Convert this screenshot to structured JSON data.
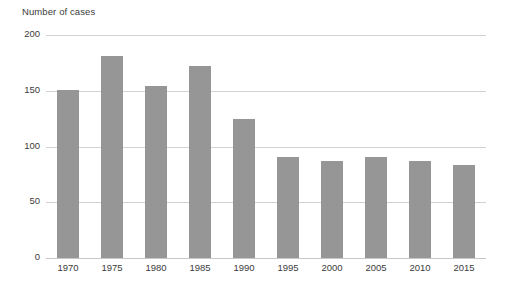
{
  "chart_data": {
    "type": "bar",
    "title": "Number of cases",
    "subtitle": "",
    "xlabel": "",
    "ylabel": "Number of cases",
    "categories": [
      "1970",
      "1975",
      "1980",
      "1985",
      "1990",
      "1995",
      "2000",
      "2005",
      "2010",
      "2015"
    ],
    "values": [
      151,
      181,
      154,
      172,
      125,
      91,
      87,
      91,
      87,
      83
    ],
    "ylim": [
      0,
      200
    ],
    "yticks": [
      "0",
      "50",
      "100",
      "150",
      "200"
    ],
    "ytick_values": [
      0,
      50,
      100,
      150,
      200
    ],
    "grid": "horizontal",
    "legend": "none",
    "series": [
      {
        "name": "Number of cases",
        "values": [
          151,
          181,
          154,
          172,
          125,
          91,
          87,
          91,
          87,
          83
        ]
      }
    ],
    "colors": {
      "bar": "#969696",
      "gridline": "#d2d2d2",
      "text": "#3c3c3c",
      "background": "#ffffff"
    }
  }
}
